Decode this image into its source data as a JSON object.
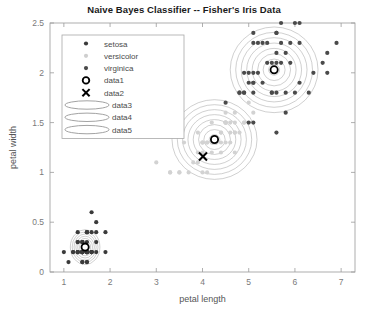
{
  "chart_data": {
    "type": "scatter",
    "title": "Naive Bayes Classifier -- Fisher's Iris Data",
    "xlabel": "petal length",
    "ylabel": "petal width",
    "xlim": [
      0.7,
      7.3
    ],
    "ylim": [
      0,
      2.5
    ],
    "xticks": [
      1,
      2,
      3,
      4,
      5,
      6,
      7
    ],
    "xticklabels": [
      "1",
      "2",
      "3",
      "4",
      "5",
      "6",
      "7"
    ],
    "yticks": [
      0,
      0.5,
      1,
      1.5,
      2,
      2.5
    ],
    "yticklabels": [
      "0",
      "0.5",
      "1",
      "1.5",
      "2",
      "2.5"
    ],
    "grid": false,
    "legend_position": "upper left",
    "legend": [
      {
        "label": "setosa",
        "marker": "filled-circle",
        "color": "#3a3a3a"
      },
      {
        "label": "versicolor",
        "marker": "filled-circle",
        "color": "#cfcfcf"
      },
      {
        "label": "virginica",
        "marker": "filled-circle",
        "color": "#4a4a4a"
      },
      {
        "label": "data1",
        "marker": "open-circle",
        "color": "#000000"
      },
      {
        "label": "data2",
        "marker": "cross-x",
        "color": "#000000"
      },
      {
        "label": "data3",
        "marker": "ellipse",
        "color": "#8a8a8a"
      },
      {
        "label": "data4",
        "marker": "ellipse",
        "color": "#8a8a8a"
      },
      {
        "label": "data5",
        "marker": "ellipse",
        "color": "#8a8a8a"
      }
    ],
    "series": [
      {
        "name": "setosa",
        "color": "#3a3a3a",
        "points": [
          [
            1.4,
            0.2
          ],
          [
            1.4,
            0.2
          ],
          [
            1.3,
            0.2
          ],
          [
            1.5,
            0.2
          ],
          [
            1.4,
            0.2
          ],
          [
            1.7,
            0.4
          ],
          [
            1.4,
            0.3
          ],
          [
            1.5,
            0.2
          ],
          [
            1.4,
            0.2
          ],
          [
            1.5,
            0.1
          ],
          [
            1.5,
            0.2
          ],
          [
            1.6,
            0.2
          ],
          [
            1.4,
            0.1
          ],
          [
            1.1,
            0.1
          ],
          [
            1.2,
            0.2
          ],
          [
            1.5,
            0.4
          ],
          [
            1.3,
            0.4
          ],
          [
            1.4,
            0.3
          ],
          [
            1.7,
            0.3
          ],
          [
            1.5,
            0.3
          ],
          [
            1.7,
            0.2
          ],
          [
            1.5,
            0.4
          ],
          [
            1.0,
            0.2
          ],
          [
            1.7,
            0.5
          ],
          [
            1.9,
            0.2
          ],
          [
            1.6,
            0.2
          ],
          [
            1.6,
            0.4
          ],
          [
            1.5,
            0.2
          ],
          [
            1.4,
            0.2
          ],
          [
            1.6,
            0.2
          ],
          [
            1.6,
            0.2
          ],
          [
            1.5,
            0.4
          ],
          [
            1.5,
            0.1
          ],
          [
            1.4,
            0.2
          ],
          [
            1.5,
            0.2
          ],
          [
            1.2,
            0.2
          ],
          [
            1.3,
            0.2
          ],
          [
            1.4,
            0.1
          ],
          [
            1.3,
            0.2
          ],
          [
            1.5,
            0.2
          ],
          [
            1.3,
            0.3
          ],
          [
            1.3,
            0.3
          ],
          [
            1.3,
            0.2
          ],
          [
            1.6,
            0.6
          ],
          [
            1.9,
            0.4
          ],
          [
            1.4,
            0.3
          ],
          [
            1.6,
            0.2
          ],
          [
            1.4,
            0.2
          ],
          [
            1.5,
            0.2
          ],
          [
            1.4,
            0.2
          ]
        ]
      },
      {
        "name": "versicolor",
        "color": "#d2d2d2",
        "points": [
          [
            4.7,
            1.4
          ],
          [
            4.5,
            1.5
          ],
          [
            4.9,
            1.5
          ],
          [
            4.0,
            1.3
          ],
          [
            4.6,
            1.5
          ],
          [
            4.5,
            1.3
          ],
          [
            4.7,
            1.6
          ],
          [
            3.3,
            1.0
          ],
          [
            4.6,
            1.3
          ],
          [
            3.9,
            1.4
          ],
          [
            3.5,
            1.0
          ],
          [
            4.2,
            1.5
          ],
          [
            4.0,
            1.0
          ],
          [
            4.7,
            1.4
          ],
          [
            3.6,
            1.3
          ],
          [
            4.4,
            1.4
          ],
          [
            4.5,
            1.5
          ],
          [
            4.1,
            1.0
          ],
          [
            4.5,
            1.5
          ],
          [
            3.9,
            1.1
          ],
          [
            4.8,
            1.8
          ],
          [
            4.0,
            1.3
          ],
          [
            4.9,
            1.5
          ],
          [
            4.7,
            1.2
          ],
          [
            4.3,
            1.3
          ],
          [
            4.4,
            1.4
          ],
          [
            4.8,
            1.4
          ],
          [
            5.0,
            1.7
          ],
          [
            4.5,
            1.5
          ],
          [
            3.5,
            1.0
          ],
          [
            3.8,
            1.1
          ],
          [
            3.7,
            1.0
          ],
          [
            3.9,
            1.2
          ],
          [
            5.1,
            1.6
          ],
          [
            4.5,
            1.5
          ],
          [
            4.5,
            1.6
          ],
          [
            4.7,
            1.5
          ],
          [
            4.4,
            1.3
          ],
          [
            4.1,
            1.3
          ],
          [
            4.0,
            1.3
          ],
          [
            4.4,
            1.2
          ],
          [
            4.6,
            1.4
          ],
          [
            4.0,
            1.2
          ],
          [
            3.3,
            1.0
          ],
          [
            4.2,
            1.3
          ],
          [
            4.2,
            1.2
          ],
          [
            4.2,
            1.3
          ],
          [
            4.3,
            1.3
          ],
          [
            3.0,
            1.1
          ],
          [
            4.1,
            1.3
          ]
        ]
      },
      {
        "name": "virginica",
        "color": "#4a4a4a",
        "points": [
          [
            6.0,
            2.5
          ],
          [
            5.1,
            1.9
          ],
          [
            5.9,
            2.1
          ],
          [
            5.6,
            1.8
          ],
          [
            5.8,
            2.2
          ],
          [
            6.6,
            2.1
          ],
          [
            4.5,
            1.7
          ],
          [
            6.3,
            1.8
          ],
          [
            5.8,
            1.8
          ],
          [
            6.1,
            2.5
          ],
          [
            5.1,
            2.0
          ],
          [
            5.3,
            1.9
          ],
          [
            5.5,
            2.1
          ],
          [
            5.0,
            2.0
          ],
          [
            5.1,
            2.4
          ],
          [
            5.3,
            2.3
          ],
          [
            5.5,
            1.8
          ],
          [
            6.7,
            2.2
          ],
          [
            6.9,
            2.3
          ],
          [
            5.0,
            1.5
          ],
          [
            5.7,
            2.3
          ],
          [
            4.9,
            2.0
          ],
          [
            6.7,
            2.0
          ],
          [
            4.9,
            1.8
          ],
          [
            5.7,
            2.1
          ],
          [
            6.0,
            1.8
          ],
          [
            4.8,
            1.8
          ],
          [
            4.9,
            1.8
          ],
          [
            5.6,
            2.1
          ],
          [
            5.8,
            1.6
          ],
          [
            6.1,
            1.9
          ],
          [
            6.4,
            2.0
          ],
          [
            5.6,
            2.2
          ],
          [
            5.1,
            1.5
          ],
          [
            5.6,
            1.4
          ],
          [
            6.1,
            2.3
          ],
          [
            5.6,
            2.4
          ],
          [
            5.5,
            1.8
          ],
          [
            4.8,
            1.8
          ],
          [
            5.4,
            2.1
          ],
          [
            5.6,
            2.4
          ],
          [
            5.1,
            2.3
          ],
          [
            5.1,
            1.9
          ],
          [
            5.9,
            2.3
          ],
          [
            5.7,
            2.5
          ],
          [
            5.2,
            2.3
          ],
          [
            5.0,
            1.9
          ],
          [
            5.2,
            2.0
          ],
          [
            5.4,
            2.3
          ],
          [
            5.1,
            1.8
          ]
        ]
      }
    ],
    "class_centers": [
      {
        "name": "setosa",
        "marker": "open-circle",
        "x": 1.46,
        "y": 0.25
      },
      {
        "name": "versicolor",
        "marker": "open-circle",
        "x": 4.26,
        "y": 1.33
      },
      {
        "name": "virginica",
        "marker": "open-circle",
        "x": 5.55,
        "y": 2.03
      }
    ],
    "x_marker": {
      "label": "data2",
      "x": 4.01,
      "y": 1.16
    },
    "contours": {
      "description": "concentric gaussian density ellipses per class",
      "color": "#9a9a9a",
      "levels": 8,
      "groups": [
        {
          "center": [
            1.46,
            0.25
          ],
          "rx": 0.32,
          "ry": 0.175,
          "levels": 8
        },
        {
          "center": [
            4.26,
            1.33
          ],
          "rx": 0.92,
          "ry": 0.4,
          "levels": 8
        },
        {
          "center": [
            5.55,
            2.03
          ],
          "rx": 0.95,
          "ry": 0.43,
          "levels": 8
        }
      ]
    }
  }
}
